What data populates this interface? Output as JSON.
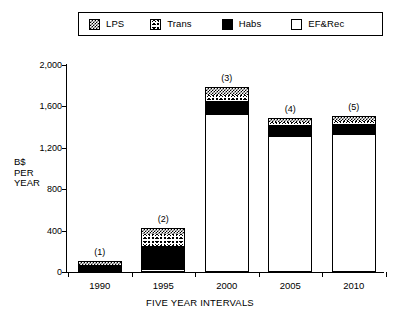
{
  "legend": {
    "items": [
      {
        "label": "LPS",
        "icon": "lps-pattern-swatch",
        "fill": "lps"
      },
      {
        "label": "Trans",
        "icon": "trans-pattern-swatch",
        "fill": "trans"
      },
      {
        "label": "Habs",
        "icon": "habs-solid-swatch",
        "fill": "habs"
      },
      {
        "label": "EF&Rec",
        "icon": "efrec-empty-swatch",
        "fill": "efrec"
      }
    ]
  },
  "axes": {
    "y_label_lines": [
      "B$",
      "PER",
      "YEAR"
    ],
    "y_ticks": [
      "0",
      "400",
      "800",
      "1,200",
      "1,600",
      "2,000"
    ],
    "x_label": "FIVE YEAR INTERVALS",
    "x_ticks": [
      "1990",
      "1995",
      "2000",
      "2005",
      "2010"
    ]
  },
  "bar_tags": [
    "(1)",
    "(2)",
    "(3)",
    "(4)",
    "(5)"
  ],
  "chart_data": {
    "type": "bar",
    "subtype": "stacked",
    "title": "",
    "xlabel": "FIVE YEAR INTERVALS",
    "ylabel": "B$ PER YEAR",
    "ylim": [
      0,
      2000
    ],
    "yticks": [
      0,
      400,
      800,
      1200,
      1600,
      2000
    ],
    "grid": false,
    "legend_position": "top",
    "categories": [
      "1990",
      "1995",
      "2000",
      "2005",
      "2010"
    ],
    "bar_labels": [
      "(1)",
      "(2)",
      "(3)",
      "(4)",
      "(5)"
    ],
    "series": [
      {
        "name": "EF&Rec",
        "fill": "white",
        "values": [
          0,
          30,
          1530,
          1310,
          1330
        ]
      },
      {
        "name": "Habs",
        "fill": "black",
        "values": [
          80,
          230,
          130,
          120,
          110
        ]
      },
      {
        "name": "Trans",
        "fill": "stipple",
        "values": [
          0,
          115,
          55,
          30,
          30
        ]
      },
      {
        "name": "LPS",
        "fill": "checkerboard",
        "values": [
          30,
          50,
          75,
          30,
          40
        ]
      }
    ],
    "totals": [
      110,
      425,
      1790,
      1490,
      1510
    ],
    "stack_order_bottom_to_top": [
      "EF&Rec",
      "Habs",
      "Trans",
      "LPS"
    ]
  }
}
